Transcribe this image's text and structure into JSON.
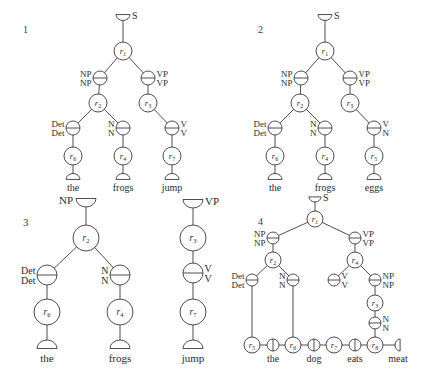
{
  "figure": {
    "panels": [
      {
        "id": "1",
        "number": {
          "text": "1",
          "x": 23,
          "y": 33
        },
        "font_size": 9,
        "node_radius": 9,
        "feature_radius": 7,
        "cup_size": 7,
        "nodes": [
          {
            "id": "root",
            "type": "cup-top",
            "x": 123,
            "y": 17,
            "label": "S",
            "label_side": "right"
          },
          {
            "id": "r1",
            "type": "rule",
            "x": 123,
            "y": 51,
            "rule": "r",
            "sub": "1"
          },
          {
            "id": "np",
            "type": "feature",
            "x": 100,
            "y": 78,
            "top": "NP",
            "bottom": "NP",
            "label_side": "left"
          },
          {
            "id": "vp",
            "type": "feature",
            "x": 148,
            "y": 78,
            "top": "VP",
            "bottom": "VP",
            "label_side": "right"
          },
          {
            "id": "r2",
            "type": "rule",
            "x": 98,
            "y": 103,
            "rule": "r",
            "sub": "2"
          },
          {
            "id": "r3",
            "type": "rule",
            "x": 148,
            "y": 103,
            "rule": "r",
            "sub": "3"
          },
          {
            "id": "det",
            "type": "feature",
            "x": 73,
            "y": 128,
            "top": "Det",
            "bottom": "Det",
            "label_side": "left"
          },
          {
            "id": "n",
            "type": "feature",
            "x": 123,
            "y": 128,
            "top": "N",
            "bottom": "N",
            "label_side": "left"
          },
          {
            "id": "v",
            "type": "feature",
            "x": 172,
            "y": 128,
            "top": "V",
            "bottom": "V",
            "label_side": "right"
          },
          {
            "id": "r6",
            "type": "rule",
            "x": 73,
            "y": 156,
            "rule": "r",
            "sub": "6"
          },
          {
            "id": "r4",
            "type": "rule",
            "x": 123,
            "y": 156,
            "rule": "r",
            "sub": "4"
          },
          {
            "id": "r7",
            "type": "rule",
            "x": 172,
            "y": 156,
            "rule": "r",
            "sub": "7"
          },
          {
            "id": "w1",
            "type": "cup-bottom",
            "x": 73,
            "y": 177,
            "word": "the"
          },
          {
            "id": "w2",
            "type": "cup-bottom",
            "x": 123,
            "y": 177,
            "word": "frogs"
          },
          {
            "id": "w3",
            "type": "cup-bottom",
            "x": 172,
            "y": 177,
            "word": "jump"
          }
        ],
        "edges": [
          [
            "root",
            "r1"
          ],
          [
            "r1",
            "np"
          ],
          [
            "r1",
            "vp"
          ],
          [
            "np",
            "r2"
          ],
          [
            "vp",
            "r3"
          ],
          [
            "r2",
            "det"
          ],
          [
            "r2",
            "n"
          ],
          [
            "r3",
            "v"
          ],
          [
            "det",
            "r6"
          ],
          [
            "n",
            "r4"
          ],
          [
            "v",
            "r7"
          ],
          [
            "r6",
            "w1"
          ],
          [
            "r4",
            "w2"
          ],
          [
            "r7",
            "w3"
          ]
        ]
      },
      {
        "id": "2",
        "number": {
          "text": "2",
          "x": 258,
          "y": 33
        },
        "font_size": 9,
        "node_radius": 9,
        "feature_radius": 7,
        "cup_size": 7,
        "nodes": [
          {
            "id": "root",
            "type": "cup-top",
            "x": 325,
            "y": 17,
            "label": "S",
            "label_side": "right"
          },
          {
            "id": "r1",
            "type": "rule",
            "x": 325,
            "y": 51,
            "rule": "r",
            "sub": "1"
          },
          {
            "id": "np",
            "type": "feature",
            "x": 301,
            "y": 78,
            "top": "NP",
            "bottom": "NP",
            "label_side": "left"
          },
          {
            "id": "vp",
            "type": "feature",
            "x": 350,
            "y": 78,
            "top": "VP",
            "bottom": "VP",
            "label_side": "right"
          },
          {
            "id": "r2",
            "type": "rule",
            "x": 300,
            "y": 103,
            "rule": "r",
            "sub": "2"
          },
          {
            "id": "r3",
            "type": "rule",
            "x": 350,
            "y": 103,
            "rule": "r",
            "sub": "3"
          },
          {
            "id": "det",
            "type": "feature",
            "x": 275,
            "y": 128,
            "top": "Det",
            "bottom": "Det",
            "label_side": "left"
          },
          {
            "id": "n",
            "type": "feature",
            "x": 325,
            "y": 128,
            "top": "N",
            "bottom": "N",
            "label_side": "left"
          },
          {
            "id": "v",
            "type": "feature",
            "x": 374,
            "y": 128,
            "top": "V",
            "bottom": "N",
            "label_side": "right"
          },
          {
            "id": "r6",
            "type": "rule",
            "x": 275,
            "y": 156,
            "rule": "r",
            "sub": "6"
          },
          {
            "id": "r4",
            "type": "rule",
            "x": 325,
            "y": 156,
            "rule": "r",
            "sub": "4"
          },
          {
            "id": "r5",
            "type": "rule",
            "x": 374,
            "y": 156,
            "rule": "r",
            "sub": "5"
          },
          {
            "id": "w1",
            "type": "cup-bottom",
            "x": 275,
            "y": 177,
            "word": "the"
          },
          {
            "id": "w2",
            "type": "cup-bottom",
            "x": 325,
            "y": 177,
            "word": "frogs"
          },
          {
            "id": "w3",
            "type": "cup-bottom",
            "x": 374,
            "y": 177,
            "word": "eggs"
          }
        ],
        "edges": [
          [
            "root",
            "r1"
          ],
          [
            "r1",
            "np"
          ],
          [
            "r1",
            "vp"
          ],
          [
            "np",
            "r2"
          ],
          [
            "vp",
            "r3"
          ],
          [
            "r2",
            "det"
          ],
          [
            "r2",
            "n"
          ],
          [
            "r3",
            "v"
          ],
          [
            "det",
            "r6"
          ],
          [
            "n",
            "r4"
          ],
          [
            "v",
            "r5"
          ],
          [
            "r6",
            "w1"
          ],
          [
            "r4",
            "w2"
          ],
          [
            "r5",
            "w3"
          ]
        ]
      },
      {
        "id": "3",
        "number": {
          "text": "3",
          "x": 23,
          "y": 226
        },
        "font_size": 10,
        "node_radius": 13,
        "feature_radius": 10,
        "cup_size": 10,
        "nodes": [
          {
            "id": "root",
            "type": "cup-top",
            "x": 86,
            "y": 202,
            "label": "NP",
            "label_side": "left"
          },
          {
            "id": "r2",
            "type": "rule",
            "x": 86,
            "y": 238,
            "rule": "r",
            "sub": "2"
          },
          {
            "id": "det",
            "type": "feature",
            "x": 47,
            "y": 275,
            "top": "Det",
            "bottom": "Det",
            "label_side": "left"
          },
          {
            "id": "n",
            "type": "feature",
            "x": 120,
            "y": 275,
            "top": "N",
            "bottom": "N",
            "label_side": "left"
          },
          {
            "id": "r6",
            "type": "rule",
            "x": 47,
            "y": 312,
            "rule": "r",
            "sub": "6"
          },
          {
            "id": "r4",
            "type": "rule",
            "x": 120,
            "y": 312,
            "rule": "r",
            "sub": "4"
          },
          {
            "id": "w1",
            "type": "cup-bottom",
            "x": 47,
            "y": 345,
            "word": "the"
          },
          {
            "id": "w2",
            "type": "cup-bottom",
            "x": 120,
            "y": 345,
            "word": "frogs"
          },
          {
            "id": "root2",
            "type": "cup-top",
            "x": 193,
            "y": 203,
            "label": "VP",
            "label_side": "right"
          },
          {
            "id": "r3",
            "type": "rule",
            "x": 193,
            "y": 238,
            "rule": "r",
            "sub": "3"
          },
          {
            "id": "v",
            "type": "feature",
            "x": 193,
            "y": 273,
            "top": "V",
            "bottom": "V",
            "label_side": "right"
          },
          {
            "id": "r7",
            "type": "rule",
            "x": 193,
            "y": 312,
            "rule": "r",
            "sub": "7"
          },
          {
            "id": "w3",
            "type": "cup-bottom",
            "x": 193,
            "y": 345,
            "word": "jump"
          }
        ],
        "edges": [
          [
            "root",
            "r2"
          ],
          [
            "r2",
            "det"
          ],
          [
            "r2",
            "n"
          ],
          [
            "det",
            "r6"
          ],
          [
            "n",
            "r4"
          ],
          [
            "r6",
            "w1"
          ],
          [
            "r4",
            "w2"
          ],
          [
            "root2",
            "r3"
          ],
          [
            "r3",
            "v"
          ],
          [
            "v",
            "r7"
          ],
          [
            "r7",
            "w3"
          ]
        ]
      },
      {
        "id": "4",
        "number": {
          "text": "4",
          "x": 258,
          "y": 225
        },
        "font_size": 9,
        "node_radius": 8,
        "feature_radius": 6,
        "cup_size": 6,
        "nodes": [
          {
            "id": "root",
            "type": "cup-top",
            "x": 315,
            "y": 199,
            "label": "S",
            "label_side": "right"
          },
          {
            "id": "r1",
            "type": "rule",
            "x": 315,
            "y": 219,
            "rule": "r",
            "sub": "1"
          },
          {
            "id": "np",
            "type": "feature",
            "x": 273,
            "y": 238,
            "top": "NP",
            "bottom": "NP",
            "label_side": "left"
          },
          {
            "id": "vp",
            "type": "feature",
            "x": 355,
            "y": 238,
            "top": "VP",
            "bottom": "VP",
            "label_side": "right"
          },
          {
            "id": "r2",
            "type": "rule",
            "x": 273,
            "y": 260,
            "rule": "r",
            "sub": "2"
          },
          {
            "id": "r4",
            "type": "rule",
            "x": 355,
            "y": 260,
            "rule": "r",
            "sub": "4"
          },
          {
            "id": "det",
            "type": "feature",
            "x": 252,
            "y": 280,
            "top": "Det",
            "bottom": "Det",
            "label_side": "left"
          },
          {
            "id": "n",
            "type": "feature",
            "x": 293,
            "y": 280,
            "top": "N",
            "bottom": "N",
            "label_side": "left"
          },
          {
            "id": "v",
            "type": "feature",
            "x": 334,
            "y": 280,
            "top": "V",
            "bottom": "V",
            "label_side": "right"
          },
          {
            "id": "np2",
            "type": "feature",
            "x": 375,
            "y": 280,
            "top": "NP",
            "bottom": "NP",
            "label_side": "right"
          },
          {
            "id": "r3",
            "type": "rule",
            "x": 375,
            "y": 303,
            "rule": "r",
            "sub": "3"
          },
          {
            "id": "n2",
            "type": "feature",
            "x": 375,
            "y": 323,
            "top": "N",
            "bottom": "N",
            "label_side": "right"
          },
          {
            "id": "r5",
            "type": "rule",
            "x": 252,
            "y": 345,
            "rule": "r",
            "sub": "5"
          },
          {
            "id": "b1",
            "type": "bar",
            "x": 273,
            "y": 345,
            "word": "the"
          },
          {
            "id": "r6",
            "type": "rule",
            "x": 293,
            "y": 345,
            "rule": "r",
            "sub": "6"
          },
          {
            "id": "b2",
            "type": "bar",
            "x": 314,
            "y": 345,
            "word": "dog"
          },
          {
            "id": "r7",
            "type": "rule",
            "x": 334,
            "y": 345,
            "rule": "r",
            "sub": "7"
          },
          {
            "id": "b3",
            "type": "bar",
            "x": 355,
            "y": 345,
            "word": "eats"
          },
          {
            "id": "r8",
            "type": "rule",
            "x": 375,
            "y": 345,
            "rule": "r",
            "sub": "8"
          },
          {
            "id": "end",
            "type": "cup-side",
            "x": 398,
            "y": 345,
            "word": "meat"
          }
        ],
        "edges": [
          [
            "root",
            "r1"
          ],
          [
            "r1",
            "np"
          ],
          [
            "r1",
            "vp"
          ],
          [
            "np",
            "r2"
          ],
          [
            "vp",
            "r4"
          ],
          [
            "r2",
            "det"
          ],
          [
            "r2",
            "n"
          ],
          [
            "r4",
            "v"
          ],
          [
            "r4",
            "np2"
          ],
          [
            "np2",
            "r3"
          ],
          [
            "r3",
            "n2"
          ],
          [
            "n2",
            "r8"
          ],
          [
            "det",
            "r5"
          ],
          [
            "n",
            "r6"
          ],
          [
            "r5",
            "b1"
          ],
          [
            "b1",
            "r6"
          ],
          [
            "r6",
            "b2"
          ],
          [
            "b2",
            "r7"
          ],
          [
            "r7",
            "b3"
          ],
          [
            "b3",
            "r8"
          ],
          [
            "r8",
            "end"
          ]
        ]
      }
    ]
  },
  "caption": {
    "text": "…(partially cropped caption text, illegible)…"
  }
}
